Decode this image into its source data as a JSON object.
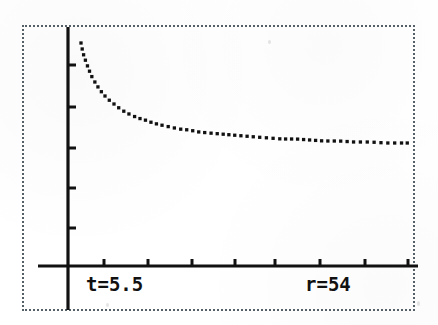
{
  "screen": {
    "width": 438,
    "height": 325,
    "background_color": "#ffffff",
    "ink_color": "#111111",
    "frame_color": "#555f66",
    "frame_style": "dotted"
  },
  "labels": {
    "trace_t": "t=5.5",
    "trace_r": "r=54"
  },
  "chart_data": {
    "type": "line",
    "title": "",
    "xlabel": "",
    "ylabel": "",
    "subtitle": "",
    "render_style": "dotted",
    "grid": false,
    "legend": null,
    "annotations": [
      {
        "name": "trace-t",
        "text": "t=5.5",
        "x_px": 86,
        "y_px": 275
      },
      {
        "name": "trace-r",
        "text": "r=54",
        "x_px": 305,
        "y_px": 275
      }
    ],
    "axes": {
      "origin_px": {
        "x": 68,
        "y": 266
      },
      "x_axis_px": {
        "x1": 38,
        "x2": 418,
        "y": 266
      },
      "y_axis_px": {
        "y1": 27,
        "y2": 310,
        "x": 68
      },
      "x_tick_px": [
        104,
        148,
        192,
        235,
        275,
        320,
        365,
        408
      ],
      "y_tick_px": [
        65,
        107,
        148,
        188,
        228
      ],
      "x_tick_labels": [],
      "y_tick_labels": [],
      "xlim": [
        -0.8,
        9.2
      ],
      "ylim": [
        -1.2,
        7.0
      ]
    },
    "series": [
      {
        "name": "decay",
        "description": "reciprocal / inverse decay curve, asymptotic to the x-axis",
        "x": [
          0.33,
          0.4,
          0.47,
          0.55,
          0.64,
          0.74,
          0.85,
          0.97,
          1.1,
          1.25,
          1.41,
          1.58,
          1.77,
          1.97,
          2.19,
          2.42,
          2.67,
          2.93,
          3.21,
          3.5,
          3.81,
          4.13,
          4.47,
          4.82,
          5.19,
          5.57,
          5.97,
          6.38,
          6.81,
          7.25,
          7.71,
          8.18,
          8.67,
          9.0
        ],
        "y": [
          6.6,
          5.85,
          5.18,
          4.58,
          4.05,
          3.58,
          3.16,
          2.79,
          2.46,
          2.17,
          1.92,
          1.7,
          1.5,
          1.33,
          1.18,
          1.05,
          0.93,
          0.83,
          0.74,
          0.66,
          0.59,
          0.53,
          0.48,
          0.43,
          0.39,
          0.35,
          0.32,
          0.29,
          0.27,
          0.24,
          0.22,
          0.21,
          0.19,
          0.18
        ],
        "points_px": [
          [
            81,
            43
          ],
          [
            83,
            53
          ],
          [
            86,
            62
          ],
          [
            89,
            70
          ],
          [
            92,
            77
          ],
          [
            96,
            84
          ],
          [
            100,
            90
          ],
          [
            104,
            95
          ],
          [
            109,
            100
          ],
          [
            114,
            104
          ],
          [
            119,
            108
          ],
          [
            125,
            112
          ],
          [
            131,
            115
          ],
          [
            138,
            118
          ],
          [
            145,
            120
          ],
          [
            153,
            123
          ],
          [
            161,
            125
          ],
          [
            170,
            127
          ],
          [
            179,
            129
          ],
          [
            189,
            130
          ],
          [
            199,
            132
          ],
          [
            209,
            133
          ],
          [
            221,
            134
          ],
          [
            232,
            135
          ],
          [
            244,
            136
          ],
          [
            256,
            137
          ],
          [
            269,
            138
          ],
          [
            282,
            139
          ],
          [
            296,
            139
          ],
          [
            310,
            140
          ],
          [
            324,
            141
          ],
          [
            339,
            141
          ],
          [
            354,
            142
          ],
          [
            370,
            142
          ],
          [
            386,
            143
          ],
          [
            402,
            143
          ],
          [
            410,
            143
          ]
        ]
      }
    ]
  }
}
